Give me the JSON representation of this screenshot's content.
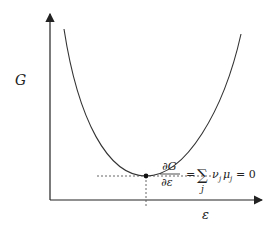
{
  "diagram": {
    "y_axis_label": "G",
    "x_axis_label": "ε",
    "equation": {
      "numerator": "∂G",
      "denominator": "∂ε",
      "equals": "=",
      "sum": "∑",
      "sum_index": "j",
      "term": "ν",
      "term_sub": "j",
      "term2": "μ",
      "term2_sub": "j",
      "rhs": "= 0"
    },
    "colors": {
      "curve": "#333333",
      "axis": "#222222",
      "dashed": "#555555"
    }
  }
}
